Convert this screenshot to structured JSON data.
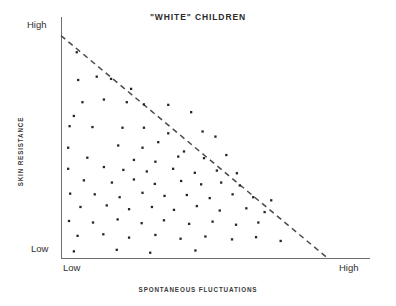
{
  "chart_data": {
    "type": "scatter",
    "title": "\"WHITE\" CHILDREN",
    "xlabel": "SPONTANEOUS FLUCTUATIONS",
    "ylabel": "SKIN RESISTANCE",
    "x_tick_labels": [
      "Low",
      "High"
    ],
    "y_tick_labels": [
      "Low",
      "High"
    ],
    "xlim": [
      0,
      1
    ],
    "ylim": [
      0,
      1
    ],
    "grid": false,
    "legend": null,
    "annotations": [
      {
        "name": "upper-boundary",
        "type": "dashed-line",
        "description": "Dashed diagonal boundary from top-left (Low fluctuations, High resistance) to bottom-right (High fluctuations, Low resistance); no data points lie above it",
        "from": [
          0.0,
          1.0
        ],
        "to": [
          0.93,
          0.0
        ]
      }
    ],
    "point_count": 85,
    "points": [
      [
        0.055,
        0.925
      ],
      [
        0.06,
        0.8
      ],
      [
        0.125,
        0.815
      ],
      [
        0.175,
        0.805
      ],
      [
        0.245,
        0.76
      ],
      [
        0.075,
        0.7
      ],
      [
        0.15,
        0.712
      ],
      [
        0.23,
        0.7
      ],
      [
        0.29,
        0.69
      ],
      [
        0.375,
        0.688
      ],
      [
        0.045,
        0.638
      ],
      [
        0.455,
        0.655
      ],
      [
        0.03,
        0.592
      ],
      [
        0.11,
        0.588
      ],
      [
        0.215,
        0.585
      ],
      [
        0.29,
        0.585
      ],
      [
        0.375,
        0.56
      ],
      [
        0.495,
        0.568
      ],
      [
        0.54,
        0.545
      ],
      [
        0.025,
        0.495
      ],
      [
        0.2,
        0.505
      ],
      [
        0.285,
        0.495
      ],
      [
        0.34,
        0.52
      ],
      [
        0.43,
        0.478
      ],
      [
        0.092,
        0.45
      ],
      [
        0.255,
        0.44
      ],
      [
        0.33,
        0.432
      ],
      [
        0.41,
        0.455
      ],
      [
        0.5,
        0.448
      ],
      [
        0.578,
        0.462
      ],
      [
        0.025,
        0.4
      ],
      [
        0.15,
        0.408
      ],
      [
        0.218,
        0.395
      ],
      [
        0.3,
        0.388
      ],
      [
        0.392,
        0.4
      ],
      [
        0.468,
        0.382
      ],
      [
        0.545,
        0.392
      ],
      [
        0.615,
        0.38
      ],
      [
        0.08,
        0.348
      ],
      [
        0.178,
        0.338
      ],
      [
        0.255,
        0.352
      ],
      [
        0.328,
        0.332
      ],
      [
        0.42,
        0.345
      ],
      [
        0.49,
        0.33
      ],
      [
        0.56,
        0.338
      ],
      [
        0.625,
        0.325
      ],
      [
        0.032,
        0.288
      ],
      [
        0.118,
        0.285
      ],
      [
        0.205,
        0.272
      ],
      [
        0.285,
        0.292
      ],
      [
        0.362,
        0.278
      ],
      [
        0.44,
        0.282
      ],
      [
        0.52,
        0.268
      ],
      [
        0.6,
        0.285
      ],
      [
        0.672,
        0.272
      ],
      [
        0.735,
        0.258
      ],
      [
        0.068,
        0.228
      ],
      [
        0.16,
        0.235
      ],
      [
        0.238,
        0.218
      ],
      [
        0.318,
        0.228
      ],
      [
        0.395,
        0.215
      ],
      [
        0.475,
        0.232
      ],
      [
        0.555,
        0.212
      ],
      [
        0.648,
        0.222
      ],
      [
        0.712,
        0.205
      ],
      [
        0.028,
        0.165
      ],
      [
        0.112,
        0.158
      ],
      [
        0.198,
        0.172
      ],
      [
        0.282,
        0.155
      ],
      [
        0.36,
        0.168
      ],
      [
        0.448,
        0.152
      ],
      [
        0.53,
        0.162
      ],
      [
        0.612,
        0.148
      ],
      [
        0.69,
        0.158
      ],
      [
        0.058,
        0.098
      ],
      [
        0.148,
        0.105
      ],
      [
        0.238,
        0.09
      ],
      [
        0.33,
        0.102
      ],
      [
        0.418,
        0.085
      ],
      [
        0.505,
        0.095
      ],
      [
        0.598,
        0.082
      ],
      [
        0.682,
        0.092
      ],
      [
        0.768,
        0.075
      ],
      [
        0.045,
        0.028
      ],
      [
        0.195,
        0.035
      ],
      [
        0.312,
        0.022
      ],
      [
        0.47,
        0.032
      ]
    ]
  },
  "plot_geometry": {
    "origin_x_px": 61,
    "origin_y_px": 257.6,
    "plot_width_px": 286,
    "plot_height_px": 222
  }
}
